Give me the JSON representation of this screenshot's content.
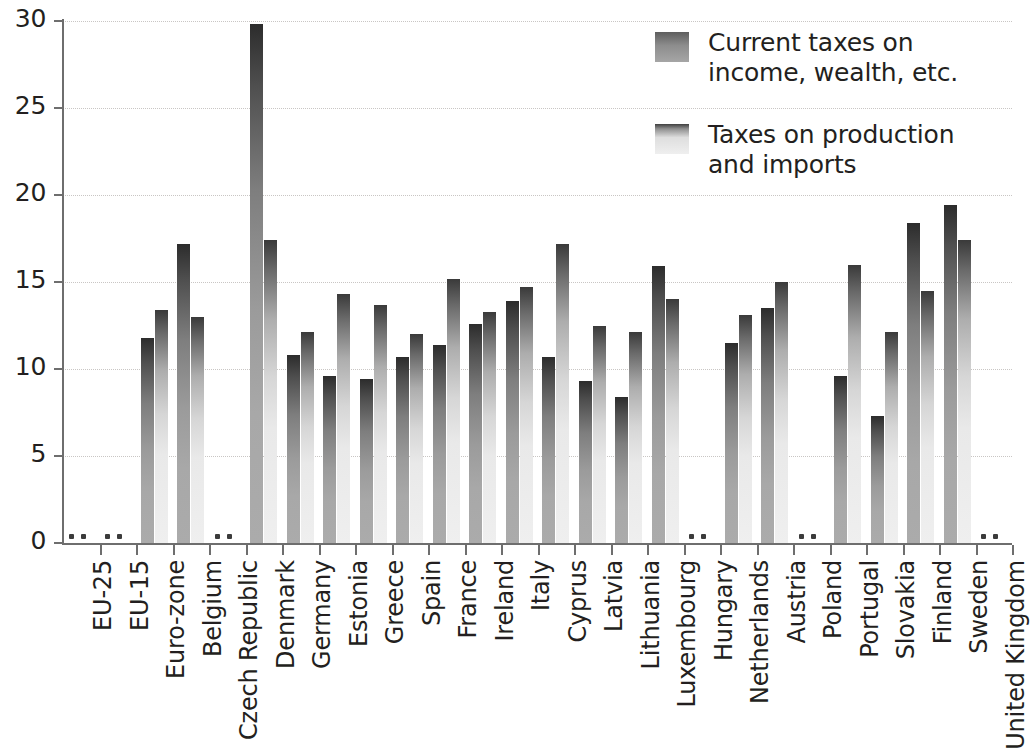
{
  "chart_data": {
    "type": "bar",
    "title": "",
    "subtitle": "",
    "xlabel": "",
    "ylabel": "",
    "ylim": [
      0,
      30
    ],
    "ytick_labels": [
      "0",
      "5",
      "10",
      "15",
      "20",
      "25",
      "30"
    ],
    "ytick_values": [
      0,
      5,
      10,
      15,
      20,
      25,
      30
    ],
    "grid": true,
    "legend_position": "top-right",
    "missing_value_symbol": ":",
    "categories": [
      "EU-25",
      "EU-15",
      "Euro-zone",
      "Belgium",
      "Czech Republic",
      "Denmark",
      "Germany",
      "Estonia",
      "Greece",
      "Spain",
      "France",
      "Ireland",
      "Italy",
      "Cyprus",
      "Latvia",
      "Lithuania",
      "Luxembourg",
      "Hungary",
      "Netherlands",
      "Austria",
      "Poland",
      "Portugal",
      "Slovakia",
      "Finland",
      "Sweden",
      "United Kingdom"
    ],
    "series": [
      {
        "name": "Current taxes on income, wealth, etc.",
        "color": "#8a8a8a",
        "values": [
          null,
          null,
          11.8,
          17.2,
          null,
          29.8,
          10.8,
          9.6,
          9.4,
          10.7,
          11.4,
          12.6,
          13.9,
          10.7,
          9.3,
          8.4,
          15.9,
          null,
          11.5,
          13.5,
          null,
          9.6,
          7.3,
          18.4,
          19.4,
          null
        ]
      },
      {
        "name": "Taxes on production and imports",
        "color": "#dcdcdc",
        "values": [
          null,
          null,
          13.4,
          13.0,
          null,
          17.4,
          12.1,
          14.3,
          13.7,
          12.0,
          15.2,
          13.3,
          14.7,
          17.2,
          12.5,
          12.1,
          14.0,
          null,
          13.1,
          15.0,
          null,
          16.0,
          12.1,
          14.5,
          17.4,
          null
        ]
      }
    ]
  },
  "legend": {
    "items": [
      {
        "label": "Current taxes on income, wealth, etc.",
        "swatch": "sw-a"
      },
      {
        "label": "Taxes on production and imports",
        "swatch": "sw-b"
      }
    ]
  }
}
